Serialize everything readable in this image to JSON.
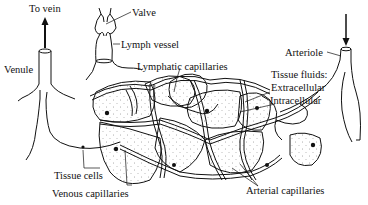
{
  "diagram": {
    "type": "anatomical-illustration",
    "colors": {
      "background": "#ffffff",
      "ink": "#111111",
      "stipple": "#555555"
    },
    "labels": {
      "to_vein": "To vein",
      "valve": "Valve",
      "lymph_vessel": "Lymph vessel",
      "venule": "Venule",
      "lymphatic_capillaries": "Lymphatic capillaries",
      "arteriole": "Arteriole",
      "tissue_fluids": "Tissue fluids:",
      "extracellular": "Extracellular",
      "intracellular": "Intracellular",
      "tissue_cells": "Tissue cells",
      "venous_capillaries": "Venous capillaries",
      "arterial_capillaries": "Arterial capillaries"
    },
    "arrows": [
      {
        "name": "to-vein-arrow",
        "direction": "up"
      },
      {
        "name": "arteriole-arrow",
        "direction": "down"
      }
    ]
  }
}
